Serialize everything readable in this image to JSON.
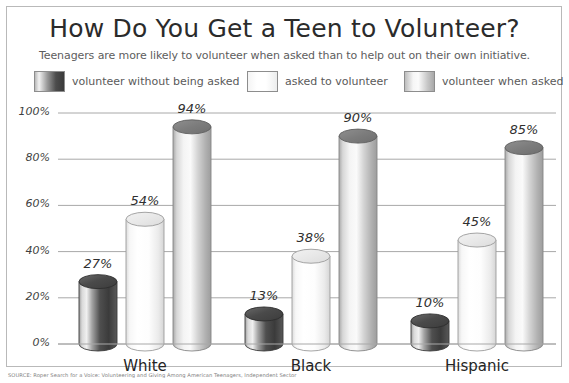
{
  "header": {
    "title": "How Do You Get a Teen to Volunteer?",
    "subtitle": "Teenagers are more likely to volunteer when asked than to help out on their own initiative."
  },
  "legend": {
    "items": [
      {
        "label": "volunteer without being asked",
        "swatch": "dark",
        "color": "#4c4c4c"
      },
      {
        "label": "asked to volunteer",
        "swatch": "light",
        "color": "#fdfdfd"
      },
      {
        "label": "volunteer when asked",
        "swatch": "mid",
        "color": "#c6c6c6"
      }
    ]
  },
  "source": {
    "text": "SOURCE: Roper Search for a Voice: Volunteering and Giving Among American Teenagers, Independent Sector"
  },
  "chart_data": {
    "type": "bar",
    "title": "How Do You Get a Teen to Volunteer?",
    "subtitle": "Teenagers are more likely to volunteer when asked than to help out on their own initiative.",
    "xlabel": "",
    "ylabel": "",
    "ylim": [
      0,
      100
    ],
    "yticks": [
      0,
      20,
      40,
      60,
      80,
      100
    ],
    "ytick_labels": [
      "0%",
      "20%",
      "40%",
      "60%",
      "80%",
      "100%"
    ],
    "grid": true,
    "legend_position": "top",
    "categories": [
      "White",
      "Black",
      "Hispanic"
    ],
    "series": [
      {
        "name": "volunteer without being asked",
        "values": [
          27,
          13,
          10
        ],
        "labels": [
          "27%",
          "13%",
          "10%"
        ]
      },
      {
        "name": "asked to volunteer",
        "values": [
          54,
          38,
          45
        ],
        "labels": [
          "54%",
          "38%",
          "45%"
        ]
      },
      {
        "name": "volunteer when asked",
        "values": [
          94,
          90,
          85
        ],
        "labels": [
          "94%",
          "90%",
          "85%"
        ]
      }
    ]
  }
}
